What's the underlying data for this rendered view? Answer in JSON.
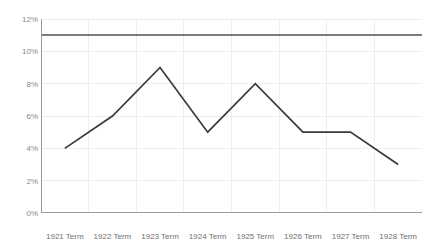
{
  "chart_data": {
    "type": "line",
    "title": "",
    "subtitle": "",
    "xlabel": "",
    "ylabel": "",
    "categories": [
      "1921 Term",
      "1922 Term",
      "1923 Term",
      "1924 Term",
      "1925 Term",
      "1926 Term",
      "1927 Term",
      "1928 Term"
    ],
    "values": [
      4,
      6,
      9,
      5,
      8,
      5,
      5,
      3
    ],
    "series": [
      {
        "name": "series-1",
        "values": [
          4,
          6,
          9,
          5,
          8,
          5,
          5,
          3
        ],
        "color": "#3a3a3a"
      }
    ],
    "ylim": [
      0,
      12
    ],
    "ytick_values": [
      0,
      2,
      4,
      6,
      8,
      10,
      12
    ],
    "ytick_labels": [
      "0%",
      "2%",
      "4%",
      "6%",
      "8%",
      "10%",
      "12%"
    ],
    "grid": true,
    "grid_color": "#eeeeee",
    "legend": false,
    "legend_position": "none",
    "annotations": [
      {
        "type": "horizontal-reference-line",
        "value": 11,
        "label": "",
        "color": "#7d7d7d"
      }
    ],
    "axis_color": "#9a9a9a",
    "background": "#ffffff"
  }
}
